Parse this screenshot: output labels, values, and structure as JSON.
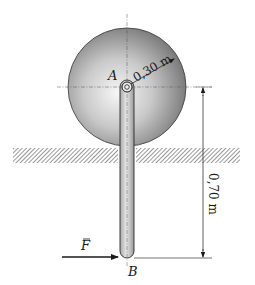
{
  "diagram": {
    "type": "mechanics-figure",
    "labels": {
      "pivot": "A",
      "end": "B",
      "force": "F",
      "radius_dimension": "0,30 m",
      "length_dimension": "0,70 m"
    },
    "quantities": {
      "sphere_radius_m": 0.3,
      "distance_A_to_B_m": 0.7
    },
    "colors": {
      "sphere_light": "#f4f4f4",
      "sphere_dark": "#6a6a6a",
      "bar_fill": "#d8d8d8",
      "ink": "#1a1a1a",
      "hatch": "#444444"
    }
  }
}
